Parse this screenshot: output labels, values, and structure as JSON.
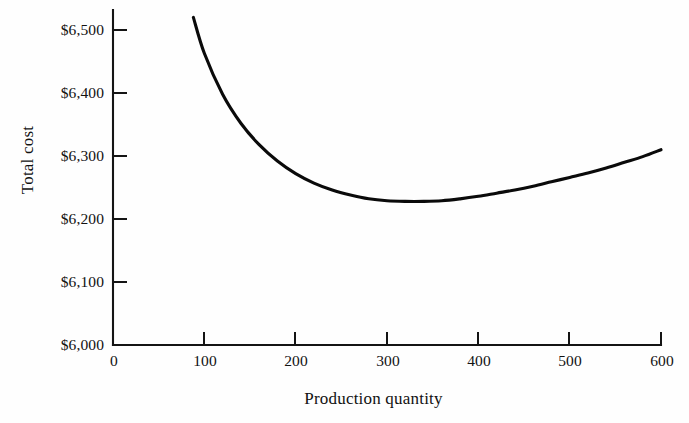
{
  "chart_data": {
    "type": "line",
    "title": "",
    "subtitle": "",
    "xlabel": "Production quantity",
    "ylabel": "Total cost",
    "xlim": [
      0,
      600
    ],
    "ylim": [
      6000,
      6500
    ],
    "xticks": [
      0,
      100,
      200,
      300,
      400,
      500,
      600
    ],
    "xtick_labels": [
      "0",
      "100",
      "200",
      "300",
      "400",
      "500",
      "600"
    ],
    "yticks": [
      6000,
      6100,
      6200,
      6300,
      6400,
      6500
    ],
    "ytick_labels": [
      "$6,000",
      "$6,100",
      "$6,200",
      "$6,300",
      "$6,400",
      "$6,500"
    ],
    "grid": false,
    "legend": false,
    "legend_position": "none",
    "annotations": [],
    "series": [
      {
        "name": "Total cost",
        "color": "#0a0a0a",
        "line_width": 3,
        "x": [
          88,
          100,
          120,
          140,
          160,
          180,
          200,
          220,
          240,
          260,
          280,
          300,
          320,
          340,
          360,
          380,
          400,
          420,
          440,
          460,
          480,
          500,
          520,
          540,
          560,
          580,
          600
        ],
        "y": [
          6520,
          6463,
          6398,
          6352,
          6318,
          6292,
          6272,
          6257,
          6246,
          6238,
          6232,
          6229,
          6228,
          6228,
          6229,
          6232,
          6236,
          6241,
          6246,
          6252,
          6259,
          6266,
          6273,
          6281,
          6290,
          6299,
          6310
        ],
        "minimum": {
          "x": 310,
          "y": 6228
        },
        "start_point": {
          "x": 88,
          "y": 6520
        },
        "end_point": {
          "x": 600,
          "y": 6310
        }
      }
    ]
  },
  "axes": {
    "y_title": "Total cost",
    "x_title": "Production quantity",
    "tick_direction": "inward",
    "axis_color": "#141414",
    "background": "#fefefe"
  }
}
